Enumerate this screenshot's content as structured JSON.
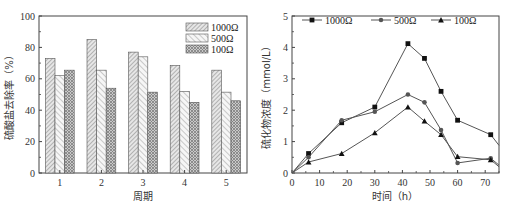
{
  "chart_data": [
    {
      "type": "bar",
      "title": "",
      "xlabel": "周期",
      "ylabel": "硫酸盐去除率（%）",
      "categories": [
        "1",
        "2",
        "3",
        "4",
        "5"
      ],
      "series": [
        {
          "name": "1000Ω",
          "values": [
            73,
            85,
            77,
            68.5,
            65.5
          ],
          "pattern": "dense-diagonal"
        },
        {
          "name": "500Ω",
          "values": [
            62,
            65.5,
            74,
            52,
            51.5
          ],
          "pattern": "sparse-diagonal"
        },
        {
          "name": "100Ω",
          "values": [
            65.5,
            54,
            51.5,
            45,
            46
          ],
          "pattern": "cross-hatch"
        }
      ],
      "ylim": [
        0,
        100
      ],
      "yticks": [
        0,
        20,
        40,
        60,
        80,
        100
      ],
      "grid": false,
      "legend_position": "upper-right"
    },
    {
      "type": "line",
      "title": "",
      "xlabel": "时间（h）",
      "ylabel": "硫化物浓度（mmol/L）",
      "x": [
        0,
        6,
        18,
        30,
        42,
        48,
        54,
        60,
        72,
        75
      ],
      "series": [
        {
          "name": "1000Ω",
          "marker": "square",
          "values": [
            0,
            0.62,
            1.6,
            2.1,
            4.12,
            3.65,
            2.6,
            1.68,
            1.22,
            0.88
          ]
        },
        {
          "name": "500Ω",
          "marker": "circle",
          "values": [
            0,
            0.5,
            1.68,
            1.95,
            2.5,
            2.25,
            1.37,
            0.32,
            0.47,
            0.25
          ]
        },
        {
          "name": "100Ω",
          "marker": "triangle",
          "values": [
            0,
            0.35,
            0.62,
            1.28,
            2.1,
            1.65,
            1.22,
            0.52,
            0.42,
            0.2
          ]
        }
      ],
      "xlim": [
        0,
        75
      ],
      "ylim": [
        0,
        5
      ],
      "xticks": [
        0,
        10,
        20,
        30,
        40,
        50,
        60,
        70
      ],
      "yticks": [
        0,
        1,
        2,
        3,
        4,
        5
      ],
      "grid": false,
      "legend_position": "top, horizontal"
    }
  ],
  "colors": {
    "axis": "#444444",
    "line": "#555555",
    "marker": "#111111",
    "bar_outline": "#555555",
    "hatch": "#8a8a8a"
  }
}
